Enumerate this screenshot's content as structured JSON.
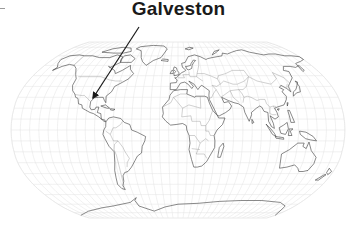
{
  "map": {
    "type": "world-map",
    "projection": "robinson",
    "graticule": true,
    "style": "outline-line-art"
  },
  "annotation": {
    "label": "Galveston",
    "pointer": "arrow-pointing-to-galveston-texas"
  },
  "colors": {
    "background": "#ffffff",
    "coastline": "#333333",
    "graticule": "#dcdcdc",
    "text": "#1a1a1a"
  }
}
